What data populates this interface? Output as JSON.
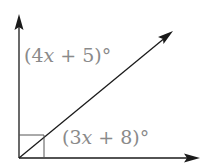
{
  "diagram": {
    "type": "angle-diagram",
    "colors": {
      "lines": "#1a1a1a",
      "labels": "#8a8a8a",
      "background": "#ffffff"
    },
    "angles": {
      "upper": {
        "prefix": "(4",
        "variable": "x",
        "suffix": " + 5)°",
        "full": "(4x + 5)°"
      },
      "lower": {
        "prefix": "(3",
        "variable": "x",
        "suffix": " + 8)°",
        "full": "(3x + 8)°"
      }
    },
    "right_angle_marker": true
  }
}
